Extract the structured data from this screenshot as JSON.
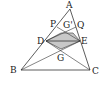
{
  "figure": {
    "type": "geometry-diagram",
    "points": {
      "A": {
        "label": "A",
        "x": 70,
        "y": 9
      },
      "B": {
        "label": "B",
        "x": 21,
        "y": 70
      },
      "C": {
        "label": "C",
        "x": 90,
        "y": 70
      },
      "D": {
        "label": "D",
        "x": 46,
        "y": 41
      },
      "E": {
        "label": "E",
        "x": 80,
        "y": 41
      },
      "P": {
        "label": "P",
        "x": 57,
        "y": 27
      },
      "Q": {
        "label": "Q",
        "x": 76,
        "y": 27
      },
      "G_prime": {
        "label": "G'",
        "x": 66,
        "y": 32
      },
      "G": {
        "label": "G",
        "x": 61,
        "y": 49
      }
    },
    "shaded_region_color": "#c8c8c8",
    "line_color": "#333333"
  }
}
